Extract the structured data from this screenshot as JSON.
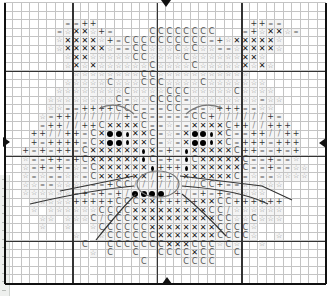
{
  "chart": {
    "columns": 38,
    "rows": 33,
    "cell_w": 8.45,
    "cell_h": 8.5,
    "origin_x": 4,
    "origin_y": 2,
    "major_every": 10,
    "major_offset_col": 8,
    "major_offset_row": 8
  },
  "legend_symbols": {
    "x": "cross",
    "s": "star",
    "=": "equals",
    "+": "plus",
    "C": "letter-c",
    "/": "slash",
    "o": "filled-dot",
    "d": "small-diamond",
    ".": "empty"
  },
  "glyphs": {
    "x": "✕",
    "s": "☆",
    "=": "=",
    "+": "+",
    "C": "C",
    "/": "/"
  },
  "pattern": [
    "......................................",
    "......................................",
    ".......==++..................++==.....",
    "......=sxxs+=....CCCCCCCC...=+sxxs=...",
    "......sxxxxs+=CCCCCCCCCC=+sxxxxxs.....",
    "......sxxxxxs==CCsssCsCss==sxxxxs.....",
    ".......sxxsssssCCssssCssssssxxs.......",
    ".......sxsxssssssCssssCsssssxsxs......",
    "........ssssssssCCsssssssssss.........",
    ".......sssssCsssCCCssssCsssssss.......",
    "......ssssssssCssssCCCsssssCssss......",
    ".....ssssssssC=ssCCCC=ssssssss=ss.....",
    ".....ss==++++CCC===CC===s+++==ss......",
    "....s=++//////+=C=====CC+//////+=.....",
    "....=++//++CxxxxC==s==xxxxC++//+++....",
    "...++//++=CxoodxxC=s=xoodxC==++//++...",
    "...+=++++=CxoodxxC=s=xoodxC=+++=+++...",
    "..+=+=++=Cxxxxxxdx=+=dxxxxxC++==+=+...",
    "..s==++=+CxxxxxxdC=+=dCxxxxxC==+==s...",
    "..s=+=+=s=Cxxxxxxd+++dxxxxxxC==+==ss..",
    "..s=s==ss=Cxxxxxx/++/xxxxxxC=s==ssss..",
    "..ss==ssss==+CC////////CC+==sssss.....",
    "..ssssss=+=+=+/oooo/+/=+=+=ssss.......",
    "...sssss+++++CCCxx+++++xxCC++++++.....",
    "...s.ssssssCCCCxxxxxxxxxCC/ssssss.....",
    "....ss.sssC/CCCxxxxxxxxxxCCssCsss.....",
    "....s..s..sCCCCCCxxxxxxxxCCCCs........",
    "........s..sCCCCCCxxxxxxxCCCCs..s.....",
    ".........C..CCCCCCCxxxCCCsCs..s.......",
    "..........s.C..C..CCCCxCC..C..........",
    "................C....CCCC.............",
    "......................................",
    "......................................"
  ],
  "markers": {
    "top_center_arrow": "top-center",
    "bottom_center_arrow": "bottom-center",
    "left_middle_arrow": "left-middle",
    "right_middle_arrow": "right-middle"
  },
  "colors": {
    "grid_minor": "#c4c4c4",
    "grid_major": "#333333",
    "border": "#111111",
    "filled_area": "#f4f4f4",
    "ruler_bg": "#eef0ee"
  }
}
